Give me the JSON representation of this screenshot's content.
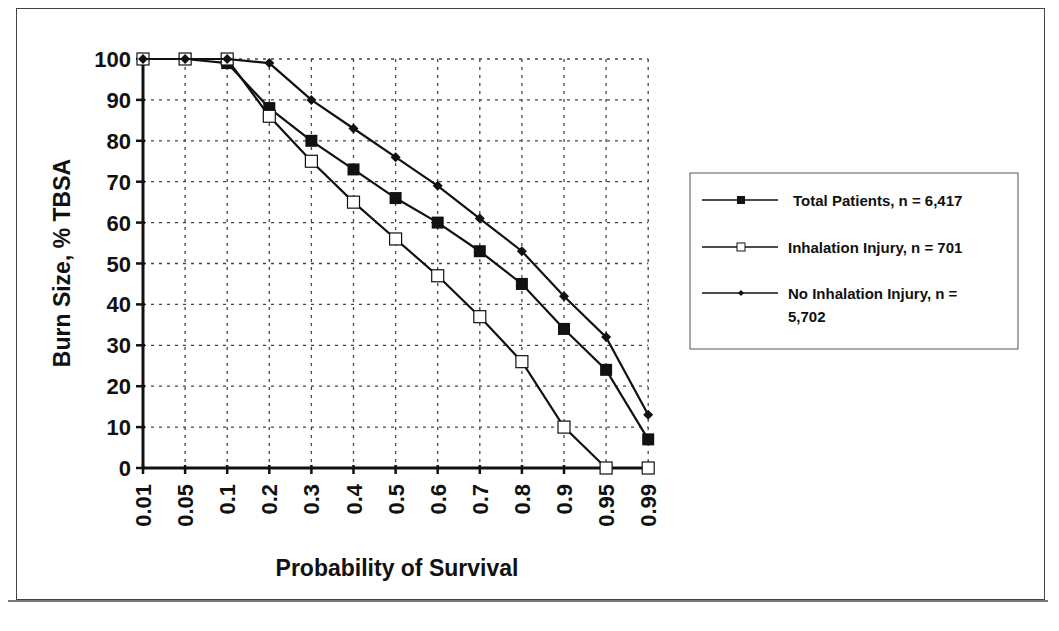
{
  "chart_data": {
    "type": "line",
    "title": "",
    "xlabel": "Probability of Survival",
    "ylabel": "Burn Size, % TBSA",
    "ylim": [
      0,
      100
    ],
    "yticks": [
      0,
      10,
      20,
      30,
      40,
      50,
      60,
      70,
      80,
      90,
      100
    ],
    "categories": [
      "0.01",
      "0.05",
      "0.1",
      "0.2",
      "0.3",
      "0.4",
      "0.5",
      "0.6",
      "0.7",
      "0.8",
      "0.9",
      "0.95",
      "0.99"
    ],
    "grid": true,
    "legend_position": "right",
    "series": [
      {
        "name": "Total Patients, n = 6,417",
        "marker": "filled-square",
        "values": [
          100,
          100,
          99,
          88,
          80,
          73,
          66,
          60,
          53,
          45,
          34,
          24,
          7
        ]
      },
      {
        "name": "Inhalation Injury, n = 701",
        "marker": "open-square",
        "values": [
          100,
          100,
          100,
          86,
          75,
          65,
          56,
          47,
          37,
          26,
          10,
          0,
          0
        ]
      },
      {
        "name": "No Inhalation Injury, n = 5,702",
        "marker": "small-diamond",
        "values": [
          100,
          100,
          100,
          99,
          90,
          83,
          76,
          69,
          61,
          53,
          42,
          32,
          13
        ]
      }
    ]
  },
  "legend": {
    "items": [
      {
        "line1": "Total Patients, n = 6,417",
        "line2": ""
      },
      {
        "line1": "Inhalation Injury, n = 701",
        "line2": ""
      },
      {
        "line1": "No Inhalation Injury, n =",
        "line2": "5,702"
      }
    ]
  },
  "colors": {
    "ink": "#111111",
    "grid": "#555555",
    "background": "#ffffff"
  }
}
